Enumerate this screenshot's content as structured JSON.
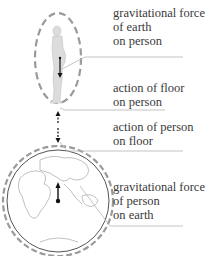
{
  "diagram": {
    "labels": [
      {
        "id": "grav_earth_on_person",
        "lines": [
          "gravitational force",
          "of earth",
          "on person"
        ]
      },
      {
        "id": "floor_on_person",
        "lines": [
          "action of floor",
          "on person"
        ]
      },
      {
        "id": "person_on_floor",
        "lines": [
          "action of person",
          "on floor"
        ]
      },
      {
        "id": "grav_person_on_earth",
        "lines": [
          "gravitational force",
          "of person",
          "on earth"
        ]
      }
    ],
    "colors": {
      "dashed_boundary": "#9a9a9a",
      "leader_line": "#b5b5b5",
      "arrow": "#111111",
      "earth_outline": "#555555",
      "continents": "#b0b0b0",
      "text": "#3a3a3a"
    }
  }
}
